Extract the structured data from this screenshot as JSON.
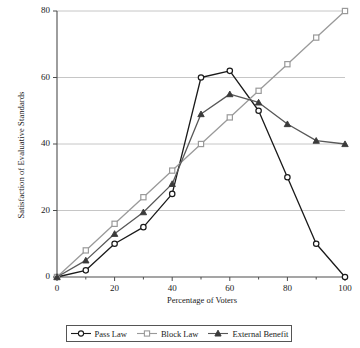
{
  "chart_data": {
    "type": "line",
    "title": "",
    "xlabel": "Percentage of Voters",
    "ylabel": "Satisfaction of Evaluative Standards",
    "x": [
      0,
      10,
      20,
      30,
      40,
      50,
      60,
      70,
      80,
      90,
      100
    ],
    "xlim": [
      0,
      100
    ],
    "ylim": [
      0,
      80
    ],
    "xticks": [
      "0",
      "20",
      "40",
      "60",
      "80",
      "100"
    ],
    "xtick_values": [
      0,
      20,
      40,
      60,
      80,
      100
    ],
    "yticks": [
      "0",
      "20",
      "40",
      "60",
      "80"
    ],
    "ytick_values": [
      0,
      20,
      40,
      60,
      80
    ],
    "grid": "horizontal",
    "legend_position": "bottom",
    "series": [
      {
        "name": "Pass Law",
        "marker": "open-circle",
        "color": "#1a1a1a",
        "values": [
          0,
          2,
          10,
          15,
          25,
          60,
          62,
          50,
          30,
          10,
          0
        ]
      },
      {
        "name": "Block Law",
        "marker": "open-square",
        "color": "#9a9a9a",
        "values": [
          0,
          8,
          16,
          24,
          32,
          40,
          48,
          56,
          64,
          72,
          80
        ]
      },
      {
        "name": "External Benefit",
        "marker": "filled-triangle",
        "color": "#585858",
        "values": [
          0,
          5,
          13,
          19.5,
          28,
          49,
          55,
          52.5,
          46,
          41,
          40
        ]
      }
    ]
  },
  "legend": {
    "items": [
      {
        "label": "Pass Law"
      },
      {
        "label": "Block Law"
      },
      {
        "label": "External Benefit"
      }
    ]
  },
  "colors": {
    "axis": "#4d4d4d",
    "grid": "#b8b8b8",
    "pass_law": "#1a1a1a",
    "block_law": "#9a9a9a",
    "external_benefit": "#585858",
    "background": "#ffffff"
  }
}
